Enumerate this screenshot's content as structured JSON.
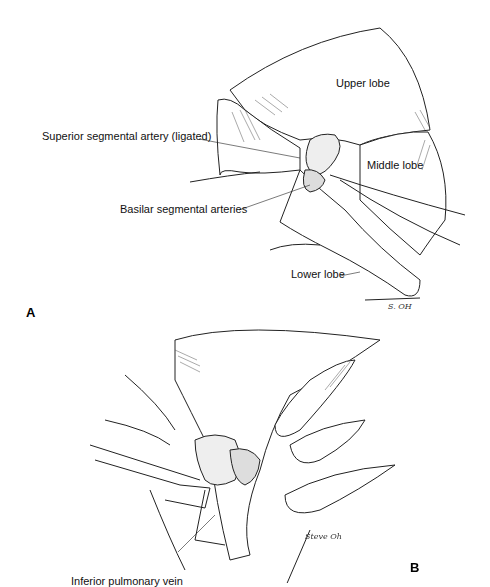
{
  "figure": {
    "panel_a": {
      "letter": "A",
      "labels": {
        "upper_lobe": "Upper lobe",
        "middle_lobe": "Middle lobe",
        "lower_lobe": "Lower lobe",
        "superior_segmental_artery": "Superior segmental artery (ligated)",
        "basilar_segmental_arteries": "Basilar segmental arteries"
      },
      "signature": "S. OH"
    },
    "panel_b": {
      "letter": "B",
      "labels": {
        "inferior_pulmonary_vein": "Inferior pulmonary vein"
      },
      "signature": "Steve Oh"
    }
  }
}
